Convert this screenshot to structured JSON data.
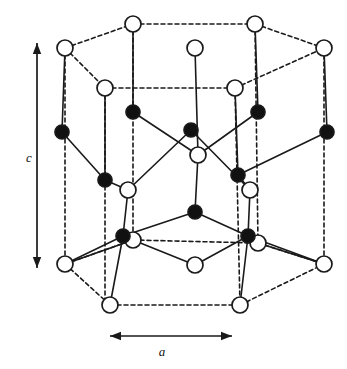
{
  "figure": {
    "axis_labels": {
      "c": "c",
      "a": "a"
    },
    "colors": {
      "stroke": "#1a1a1a",
      "open_atom_fill": "#ffffff",
      "filled_atom_fill": "#111111",
      "background": "#ffffff"
    },
    "style": {
      "open_atom_radius": 8,
      "filled_atom_radius": 7,
      "solid_line_width": 1.6,
      "dashed_line_width": 1.6,
      "dash_pattern": "4,3"
    },
    "arrows": {
      "c_axis": {
        "x1": 37,
        "y1": 43,
        "x2": 37,
        "y2": 268,
        "double_headed": true
      },
      "a_axis": {
        "x1": 110,
        "y1": 336,
        "x2": 232,
        "y2": 336,
        "double_headed": true
      }
    },
    "legend_note": "Open circles and filled circles denote the two interpenetrating atomic sublattices",
    "atoms": {
      "open": [
        {
          "id": "t-back-left",
          "x": 133,
          "y": 24
        },
        {
          "id": "t-back-right",
          "x": 255,
          "y": 24
        },
        {
          "id": "t-left",
          "x": 65,
          "y": 48
        },
        {
          "id": "t-right",
          "x": 324,
          "y": 48
        },
        {
          "id": "t-center",
          "x": 195,
          "y": 48
        },
        {
          "id": "t-mid-left",
          "x": 105,
          "y": 88
        },
        {
          "id": "t-mid-right",
          "x": 235,
          "y": 88
        },
        {
          "id": "m-center",
          "x": 198,
          "y": 155
        },
        {
          "id": "m-left",
          "x": 128,
          "y": 190
        },
        {
          "id": "m-right",
          "x": 250,
          "y": 190
        },
        {
          "id": "b-left-node",
          "x": 133,
          "y": 240
        },
        {
          "id": "b-right-node",
          "x": 258,
          "y": 243
        },
        {
          "id": "b-center",
          "x": 195,
          "y": 265
        },
        {
          "id": "b-left",
          "x": 65,
          "y": 264
        },
        {
          "id": "b-right",
          "x": 324,
          "y": 264
        },
        {
          "id": "b-front-left",
          "x": 110,
          "y": 305
        },
        {
          "id": "b-front-right",
          "x": 240,
          "y": 305
        }
      ],
      "filled": [
        {
          "id": "f-back-left",
          "x": 133,
          "y": 112
        },
        {
          "id": "f-back-right",
          "x": 258,
          "y": 112
        },
        {
          "id": "f-left",
          "x": 62,
          "y": 132
        },
        {
          "id": "f-right",
          "x": 327,
          "y": 132
        },
        {
          "id": "f-center-up",
          "x": 191,
          "y": 130
        },
        {
          "id": "f-mid-left",
          "x": 105,
          "y": 180
        },
        {
          "id": "f-mid-right",
          "x": 238,
          "y": 175
        },
        {
          "id": "f-center-low",
          "x": 195,
          "y": 212
        },
        {
          "id": "f-low-left",
          "x": 123,
          "y": 236
        },
        {
          "id": "f-low-right",
          "x": 248,
          "y": 236
        }
      ]
    },
    "dashed_edges": [
      [
        65,
        48,
        133,
        24
      ],
      [
        133,
        24,
        255,
        24
      ],
      [
        255,
        24,
        324,
        48
      ],
      [
        65,
        48,
        105,
        88
      ],
      [
        105,
        88,
        235,
        88
      ],
      [
        235,
        88,
        324,
        48
      ],
      [
        65,
        264,
        110,
        305
      ],
      [
        110,
        305,
        240,
        305
      ],
      [
        240,
        305,
        324,
        264
      ],
      [
        65,
        264,
        133,
        240
      ],
      [
        133,
        240,
        258,
        243
      ],
      [
        258,
        243,
        324,
        264
      ],
      [
        65,
        48,
        65,
        264
      ],
      [
        324,
        48,
        324,
        264
      ],
      [
        133,
        24,
        133,
        240
      ],
      [
        255,
        24,
        258,
        243
      ],
      [
        105,
        88,
        105,
        305
      ],
      [
        235,
        88,
        240,
        305
      ]
    ],
    "solid_edges": [
      [
        65,
        48,
        62,
        132
      ],
      [
        324,
        48,
        327,
        132
      ],
      [
        133,
        24,
        133,
        112
      ],
      [
        255,
        24,
        258,
        112
      ],
      [
        105,
        88,
        105,
        180
      ],
      [
        235,
        88,
        238,
        175
      ],
      [
        195,
        48,
        198,
        155
      ],
      [
        62,
        132,
        105,
        180
      ],
      [
        327,
        132,
        238,
        175
      ],
      [
        133,
        112,
        198,
        155
      ],
      [
        258,
        112,
        198,
        155
      ],
      [
        191,
        130,
        128,
        190
      ],
      [
        191,
        130,
        250,
        190
      ],
      [
        105,
        180,
        128,
        190
      ],
      [
        238,
        175,
        250,
        190
      ],
      [
        198,
        155,
        195,
        212
      ],
      [
        128,
        190,
        123,
        236
      ],
      [
        250,
        190,
        248,
        236
      ],
      [
        195,
        212,
        123,
        236
      ],
      [
        195,
        212,
        248,
        236
      ],
      [
        123,
        236,
        195,
        265
      ],
      [
        248,
        236,
        195,
        265
      ],
      [
        123,
        236,
        65,
        264
      ],
      [
        248,
        236,
        324,
        264
      ],
      [
        123,
        236,
        110,
        305
      ],
      [
        248,
        236,
        240,
        305
      ],
      [
        133,
        240,
        65,
        264
      ],
      [
        258,
        243,
        324,
        264
      ]
    ]
  }
}
